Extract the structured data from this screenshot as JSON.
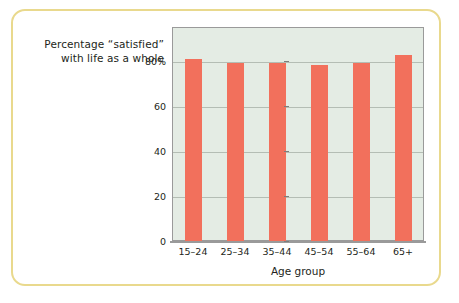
{
  "chart_data": {
    "type": "bar",
    "title_lines": [
      "Percentage “satisfied”",
      "with life as a whole"
    ],
    "title": "Percentage “satisfied” with life as a whole",
    "xlabel": "Age group",
    "ylabel": "",
    "categories": [
      "15–24",
      "25–34",
      "35–44",
      "45–54",
      "55–64",
      "65+"
    ],
    "values": [
      81,
      79,
      79,
      78,
      79,
      82.5
    ],
    "ylim": [
      0,
      95
    ],
    "yticks": [
      0,
      20,
      40,
      60,
      80
    ],
    "ytick_labels": [
      "0",
      "20",
      "40",
      "60",
      "80%"
    ],
    "grid": true,
    "legend": "none",
    "bar_color": "#f2705c",
    "plot_background": "#e4ece4",
    "frame_color": "#e9d98d",
    "axis_color": "#9a9a9a",
    "gridline_color": "#b4bdb4"
  }
}
